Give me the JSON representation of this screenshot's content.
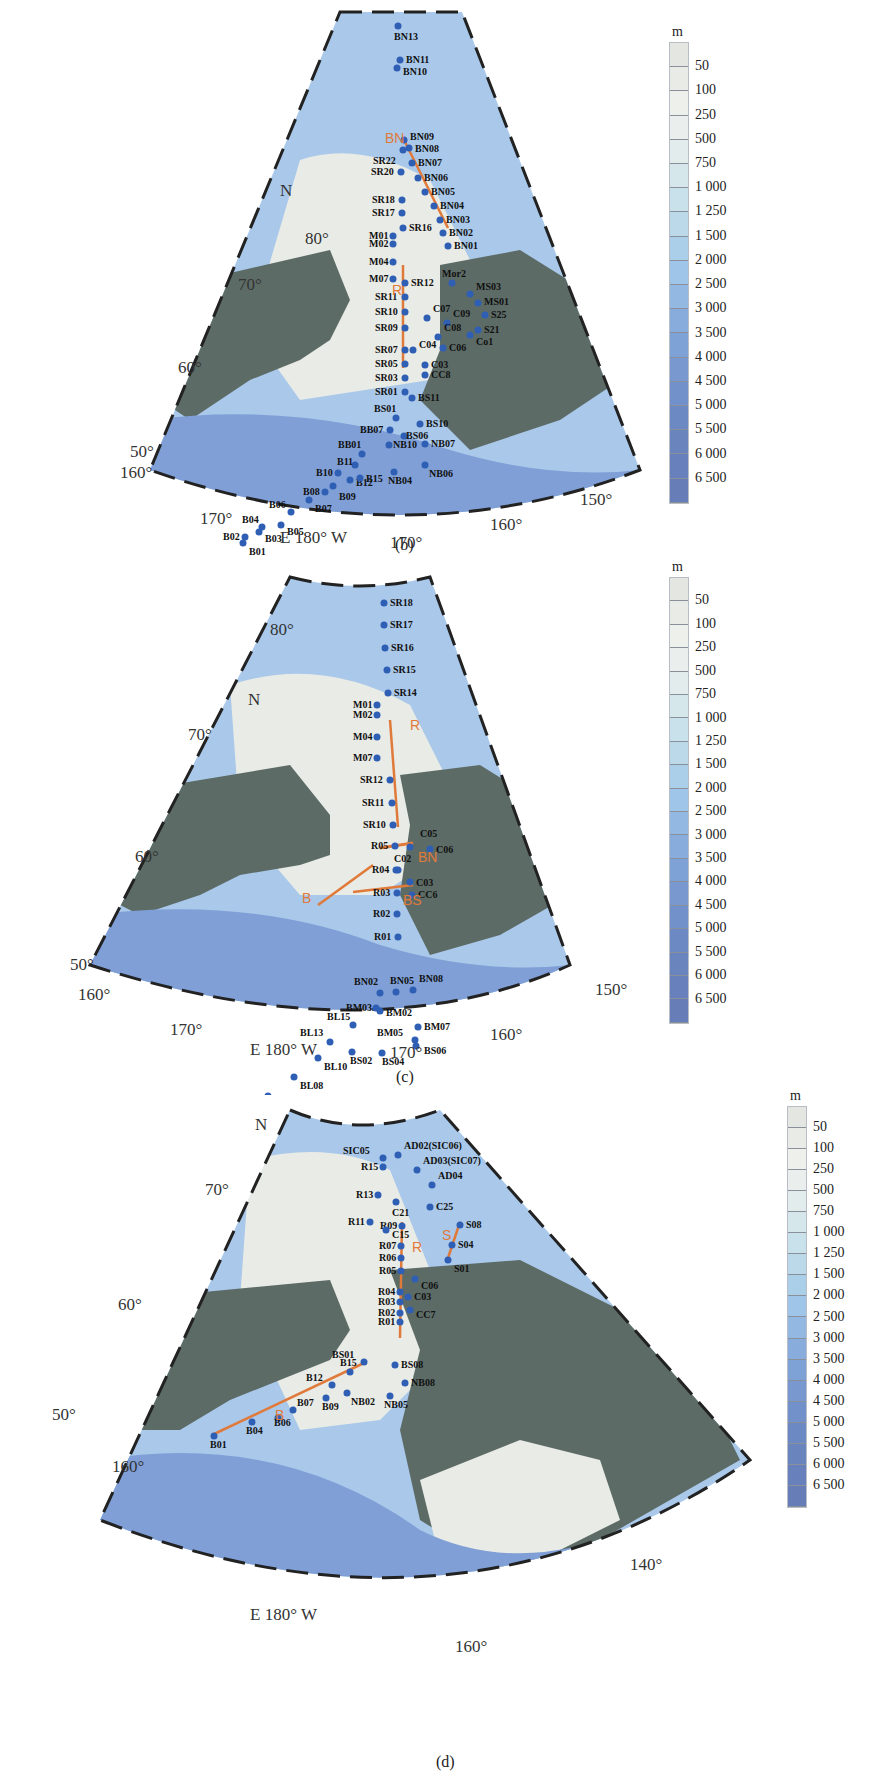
{
  "figure": {
    "panels": [
      {
        "id": "b",
        "caption": "(b)",
        "north_label": "N",
        "lat_labels": [
          "80°",
          "70°",
          "60°",
          "50°"
        ],
        "lon_labels": [
          "160°",
          "170°",
          "E 180° W",
          "170°",
          "160°",
          "150°"
        ],
        "sections": [
          {
            "name": "BN",
            "stations": [
              "BN09",
              "BN08",
              "BN07",
              "BN06",
              "BN05",
              "BN04",
              "BN03",
              "BN02",
              "BN01"
            ]
          },
          {
            "name": "R",
            "stations": [
              "SR12",
              "SR11",
              "SR10",
              "SR09",
              "SR07",
              "SR05",
              "SR03",
              "SR01"
            ]
          }
        ],
        "stations": [
          "BN13",
          "BN11",
          "BN10",
          "BN09",
          "BN08",
          "BN07",
          "BN06",
          "BN05",
          "BN04",
          "BN03",
          "BN02",
          "BN01",
          "SR22",
          "SR20",
          "SR18",
          "SR17",
          "SR16",
          "M01",
          "M02",
          "M04",
          "M07",
          "SR12",
          "SR11",
          "SR10",
          "SR09",
          "SR07",
          "SR05",
          "SR03",
          "SR01",
          "Mor2",
          "MS03",
          "MS01",
          "S25",
          "S21",
          "Co1",
          "C07",
          "C09",
          "C08",
          "C06",
          "C04",
          "C03",
          "CC8",
          "BS11",
          "BS01",
          "BS10",
          "BB07",
          "BS06",
          "NB10",
          "NB07",
          "BB01",
          "B11",
          "B10",
          "B12",
          "B15",
          "NB04",
          "NB06",
          "B08",
          "B09",
          "B07",
          "B06",
          "B05",
          "B04",
          "B02",
          "B03",
          "B01"
        ]
      },
      {
        "id": "c",
        "caption": "(c)",
        "north_label": "N",
        "lat_labels": [
          "80°",
          "70°",
          "60°",
          "50°"
        ],
        "lon_labels": [
          "160°",
          "170°",
          "E 180° W",
          "170°",
          "160°",
          "150°"
        ],
        "sections": [
          {
            "name": "R",
            "stations": [
              "SR12",
              "SR11",
              "SR10",
              "R05",
              "R04",
              "R03",
              "R02",
              "R01"
            ]
          },
          {
            "name": "BN",
            "stations": [
              "BN02",
              "BN05",
              "BN08"
            ]
          },
          {
            "name": "B",
            "stations": [
              "BL10",
              "BL13",
              "BL15",
              "BM03"
            ]
          },
          {
            "name": "BS",
            "stations": [
              "BS02",
              "BS04",
              "BS06"
            ]
          }
        ],
        "stations": [
          "SR18",
          "SR17",
          "SR16",
          "SR15",
          "SR14",
          "M01",
          "M02",
          "M04",
          "M07",
          "SR12",
          "SR11",
          "SR10",
          "R05",
          "C05",
          "C06",
          "C02",
          "R04",
          "C03",
          "R03",
          "CC6",
          "R02",
          "R01",
          "BN02",
          "BN05",
          "BN08",
          "BM03",
          "BM02",
          "BL15",
          "BM07",
          "BL13",
          "BM05",
          "BS06",
          "BS02",
          "BS04",
          "BL10",
          "BL08",
          "BL07",
          "BL06",
          "BL05",
          "BL03",
          "BL01"
        ]
      },
      {
        "id": "d",
        "caption": "(d)",
        "north_label": "N",
        "lat_labels": [
          "80°",
          "70°",
          "60°",
          "50°"
        ],
        "lon_labels": [
          "160°",
          "E 180° W",
          "160°",
          "140°"
        ],
        "sections": [
          {
            "name": "R",
            "stations": [
              "R09",
              "R07",
              "R06",
              "R05",
              "R04",
              "R03",
              "R02",
              "R01"
            ]
          },
          {
            "name": "S",
            "stations": [
              "S08",
              "S04",
              "S01"
            ]
          },
          {
            "name": "B",
            "stations": [
              "B01",
              "B04",
              "B06",
              "B07",
              "B09",
              "B12",
              "B15",
              "BS01"
            ]
          }
        ],
        "stations": [
          "SIC05",
          "AD02(SIC06)",
          "AD03(SIC07)",
          "R15",
          "AD04",
          "R13",
          "C21",
          "C25",
          "R11",
          "R09",
          "C15",
          "S08",
          "R07",
          "R06",
          "S04",
          "R05",
          "S01",
          "C06",
          "R04",
          "C03",
          "R03",
          "R02",
          "CC7",
          "R01",
          "BS01",
          "BS08",
          "NB08",
          "B15",
          "B12",
          "NB02",
          "NB05",
          "B09",
          "B07",
          "B06",
          "B04",
          "B01"
        ]
      }
    ],
    "colorbar": {
      "unit": "m",
      "ticks": [
        "50",
        "100",
        "250",
        "500",
        "750",
        "1 000",
        "1 250",
        "1 500",
        "2 000",
        "2 500",
        "3 000",
        "3 500",
        "4 000",
        "4 500",
        "5 000",
        "5 500",
        "6 000",
        "6 500"
      ],
      "colors": [
        "#e4e6e2",
        "#e9ecE6",
        "#eef0eb",
        "#eaefed",
        "#e3ecec",
        "#d6e7eb",
        "#c9e1ea",
        "#bcd9ea",
        "#accfe9",
        "#9fc5e8",
        "#93b9e3",
        "#88addd",
        "#7fa2d6",
        "#7898cf",
        "#7290c9",
        "#6d89c3",
        "#6a84be",
        "#6880bb",
        "#667db8"
      ]
    },
    "colors": {
      "ocean_deep": "#6f8fcc",
      "ocean_mid": "#a9c8ea",
      "shelf": "#e9ebe6",
      "land": "#5d6b66",
      "station": "#2f5fb5",
      "section_line": "#e07a3a"
    }
  }
}
